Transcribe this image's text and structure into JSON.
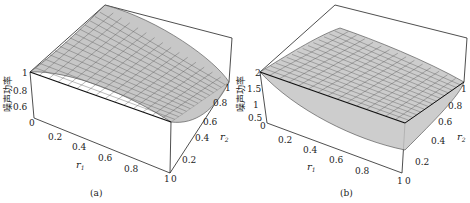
{
  "chart_data": [
    {
      "type": "surface3d",
      "panel_label": "(a)",
      "zlabel": "噪声功率",
      "xlabel": "r1",
      "ylabel": "r2",
      "x_ticks": [
        "0",
        "0.2",
        "0.4",
        "0.6",
        "0.8",
        "1"
      ],
      "y_ticks": [
        "0",
        "0.2",
        "0.4",
        "0.6",
        "0.8",
        "1"
      ],
      "z_ticks": [
        "1",
        "0.8",
        "0.6"
      ],
      "xlim": [
        0,
        1
      ],
      "ylim": [
        0,
        1
      ],
      "zlim": [
        0.5,
        1.0
      ],
      "description": "Surface decreasing from ~1 at r1=0 toward ~0.5 at r1=1, rising at far corner r2=1"
    },
    {
      "type": "surface3d",
      "panel_label": "(b)",
      "zlabel": "噪声功率",
      "xlabel": "r1",
      "ylabel": "r2",
      "x_ticks": [
        "0",
        "0.2",
        "0.4",
        "0.6",
        "0.8",
        "1"
      ],
      "y_ticks": [
        "0",
        "0.2",
        "0.4",
        "0.6",
        "0.8",
        "1"
      ],
      "z_ticks": [
        "2",
        "1.5",
        "1",
        "0.5"
      ],
      "xlim": [
        0,
        1
      ],
      "ylim": [
        0,
        1
      ],
      "zlim": [
        0.5,
        2.0
      ],
      "description": "Surface decreasing from ~2 at r1=0 toward ~0.6 at r1=1"
    }
  ],
  "panels": [
    {
      "label": "(a)",
      "zlabel": "噪声功率",
      "xlabel": "r",
      "xsub": "1",
      "ylabel": "r",
      "ysub": "2",
      "zt": [
        "1",
        "0.8",
        "0.6"
      ],
      "zero": "0",
      "xt": [
        "0.2",
        "0.4",
        "0.6",
        "0.8",
        "1"
      ],
      "yt": [
        "0.2",
        "0.4",
        "0.6",
        "0.8",
        "1"
      ],
      "corner": "0"
    },
    {
      "label": "(b)",
      "zlabel": "噪声功率",
      "xlabel": "r",
      "xsub": "1",
      "ylabel": "r",
      "ysub": "2",
      "zt": [
        "2",
        "1.5",
        "1",
        "0.5"
      ],
      "zero": "0",
      "xt": [
        "0.2",
        "0.4",
        "0.6",
        "0.8",
        "1"
      ],
      "yt": [
        "0.2",
        "0.4",
        "0.6",
        "0.8",
        "1"
      ],
      "corner": "0"
    }
  ],
  "colors": {
    "surface": "#bdbdbd",
    "mesh": "#555555",
    "box": "#222222"
  }
}
